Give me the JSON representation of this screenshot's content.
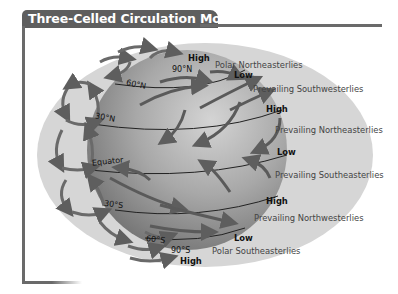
{
  "title": "Three-Celled Circulation Model",
  "latitudes": {
    "n90": "90°N",
    "n60": "60°N",
    "n30": "30°N",
    "equator": "Equator",
    "s30": "30°S",
    "s60": "60°S",
    "s90": "90°S"
  },
  "pressure": {
    "high_north_pole": "High",
    "low_60n": "Low",
    "high_30n": "High",
    "low_equator": "Low",
    "high_30s": "High",
    "low_60s": "Low",
    "high_south_pole": "High"
  },
  "winds": {
    "polar_ne": "Polar Northeasterlies",
    "prevailing_sw": "Prevailing Southwesterlies",
    "prevailing_ne": "Prevailing Northeasterlies",
    "prevailing_se": "Prevailing Southeasterlies",
    "prevailing_nw": "Prevailing Northwesterlies",
    "polar_se": "Polar Southeasterlies"
  },
  "colors": {
    "frame": "#6a6a6a",
    "outer_atmosphere": "#d2d2d2",
    "globe_light": "#c4c4c4",
    "globe_dark": "#7c7c7c",
    "arrow": "#6a6a6a"
  }
}
